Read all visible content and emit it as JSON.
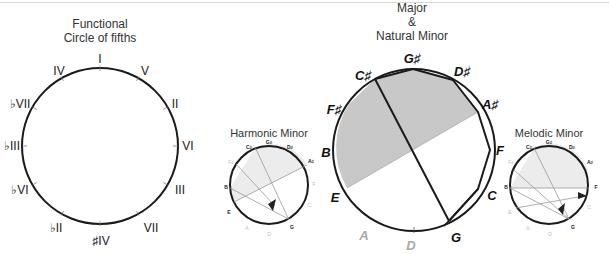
{
  "diagrams": {
    "functional": {
      "title_line1": "Functional",
      "title_line2": "Circle of fifths",
      "labels": [
        "I",
        "V",
        "II",
        "VI",
        "III",
        "VII",
        "♯IV",
        "♭II",
        "♭VI",
        "♭III",
        "♭VII",
        "IV"
      ]
    },
    "harmonic": {
      "title": "Harmonic Minor",
      "labels": [
        "G♯",
        "D♯",
        "A♯",
        "F",
        "C",
        "G",
        "D",
        "A",
        "E",
        "B",
        "F♯",
        "C♯"
      ]
    },
    "major": {
      "title_line1": "Major",
      "title_line2": "&",
      "title_line3": "Natural Minor",
      "labels": [
        "G♯",
        "D♯",
        "A♯",
        "F",
        "C",
        "G",
        "D",
        "A",
        "E",
        "B",
        "F♯",
        "C♯"
      ]
    },
    "melodic": {
      "title": "Melodic Minor",
      "labels": [
        "G♯",
        "D♯",
        "A♯",
        "F",
        "C",
        "G",
        "D",
        "A",
        "E",
        "B",
        "F♯",
        "C♯"
      ]
    }
  },
  "colors": {
    "stroke": "#1a1a1a",
    "shade": "#c8c8c8",
    "shade_light": "#ececec",
    "guide": "#9a9a9a",
    "dim_text": "#aaaaaa"
  }
}
